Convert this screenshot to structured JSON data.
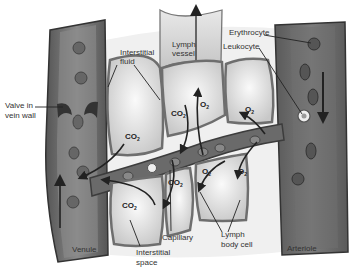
{
  "diagram": {
    "labels": {
      "interstitial_fluid_1": "Interstitial",
      "interstitial_fluid_2": "fluid",
      "lymph_vessel_1": "Lymph",
      "lymph_vessel_2": "vessel",
      "erythrocyte": "Erythrocyte",
      "leukocyte": "Leukocyte",
      "valve_1": "Valve in",
      "valve_2": "vein wall",
      "venule": "Venule",
      "interstitial_space_1": "Interstitial",
      "interstitial_space_2": "space",
      "capillary": "Capillary",
      "lymph_body_cell_1": "Lymph",
      "lymph_body_cell_2": "body cell",
      "arteriole": "Arteriole"
    },
    "gases": {
      "co2": "CO",
      "o2": "O",
      "subscript": "2"
    },
    "colors": {
      "vessel_wall_dark": "#4a4a4a",
      "vessel_fill": "#7a7a7a",
      "cell_fill": "#dcdcdc",
      "cell_border": "#6e6e6e",
      "background": "#ffffff"
    }
  }
}
